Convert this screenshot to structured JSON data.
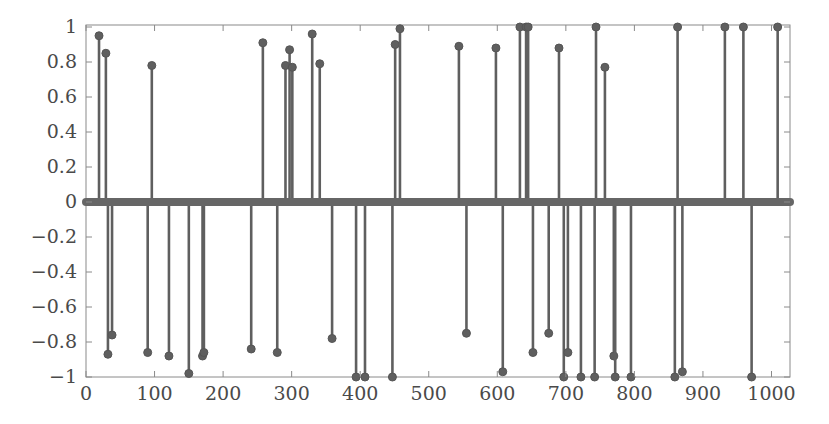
{
  "chart_data": {
    "type": "stem",
    "title": "",
    "xlabel": "",
    "ylabel": "",
    "xlim": [
      0,
      1027
    ],
    "ylim": [
      -1,
      1
    ],
    "grid": false,
    "legend": null,
    "x_ticks": [
      0,
      100,
      200,
      300,
      400,
      500,
      600,
      700,
      800,
      900,
      1000
    ],
    "x_tick_labels": [
      "0",
      "100",
      "200",
      "300",
      "400",
      "500",
      "600",
      "700",
      "800",
      "900",
      "1000"
    ],
    "y_ticks": [
      1,
      0.8,
      0.6,
      0.4,
      0.2,
      0,
      -0.2,
      -0.4,
      -0.6,
      -0.8,
      -1
    ],
    "y_tick_labels": [
      "1",
      "0.8",
      "0.6",
      "0.4",
      "0.2",
      "0",
      "−0.2",
      "−0.4",
      "−0.6",
      "−0.8",
      "−1"
    ],
    "colors": {
      "stem": "#5f5f5f",
      "marker": "#5f5f5f",
      "axis": "#8a8a8a",
      "text": "#4a4a4a",
      "baseline": "#666666"
    },
    "points": [
      {
        "x": 19,
        "y": 0.95
      },
      {
        "x": 29,
        "y": 0.85
      },
      {
        "x": 32,
        "y": -0.87
      },
      {
        "x": 38,
        "y": -0.76
      },
      {
        "x": 90,
        "y": -0.86
      },
      {
        "x": 96,
        "y": 0.78
      },
      {
        "x": 121,
        "y": -0.88
      },
      {
        "x": 150,
        "y": -0.98
      },
      {
        "x": 170,
        "y": -0.88
      },
      {
        "x": 172,
        "y": -0.86
      },
      {
        "x": 241,
        "y": -0.84
      },
      {
        "x": 258,
        "y": 0.91
      },
      {
        "x": 279,
        "y": -0.86
      },
      {
        "x": 291,
        "y": 0.78
      },
      {
        "x": 297,
        "y": 0.87
      },
      {
        "x": 301,
        "y": 0.77
      },
      {
        "x": 330,
        "y": 0.96
      },
      {
        "x": 341,
        "y": 0.79
      },
      {
        "x": 359,
        "y": -0.78
      },
      {
        "x": 394,
        "y": -1.0
      },
      {
        "x": 407,
        "y": -1.0
      },
      {
        "x": 447,
        "y": -1.0
      },
      {
        "x": 451,
        "y": 0.9
      },
      {
        "x": 458,
        "y": 0.99
      },
      {
        "x": 544,
        "y": 0.89
      },
      {
        "x": 555,
        "y": -0.75
      },
      {
        "x": 598,
        "y": 0.88
      },
      {
        "x": 608,
        "y": -0.97
      },
      {
        "x": 633,
        "y": 1.0
      },
      {
        "x": 642,
        "y": 1.0
      },
      {
        "x": 645,
        "y": 1.0
      },
      {
        "x": 652,
        "y": -0.86
      },
      {
        "x": 675,
        "y": -0.75
      },
      {
        "x": 690,
        "y": 0.88
      },
      {
        "x": 697,
        "y": -1.0
      },
      {
        "x": 703,
        "y": -0.86
      },
      {
        "x": 722,
        "y": -1.0
      },
      {
        "x": 742,
        "y": -1.0
      },
      {
        "x": 744,
        "y": 1.0
      },
      {
        "x": 757,
        "y": 0.77
      },
      {
        "x": 770,
        "y": -0.88
      },
      {
        "x": 772,
        "y": -1.0
      },
      {
        "x": 795,
        "y": -1.0
      },
      {
        "x": 859,
        "y": -1.0
      },
      {
        "x": 863,
        "y": 1.0
      },
      {
        "x": 870,
        "y": -0.97
      },
      {
        "x": 932,
        "y": 1.0
      },
      {
        "x": 959,
        "y": 1.0
      },
      {
        "x": 971,
        "y": -1.0
      },
      {
        "x": 1009,
        "y": 1.0
      }
    ]
  }
}
